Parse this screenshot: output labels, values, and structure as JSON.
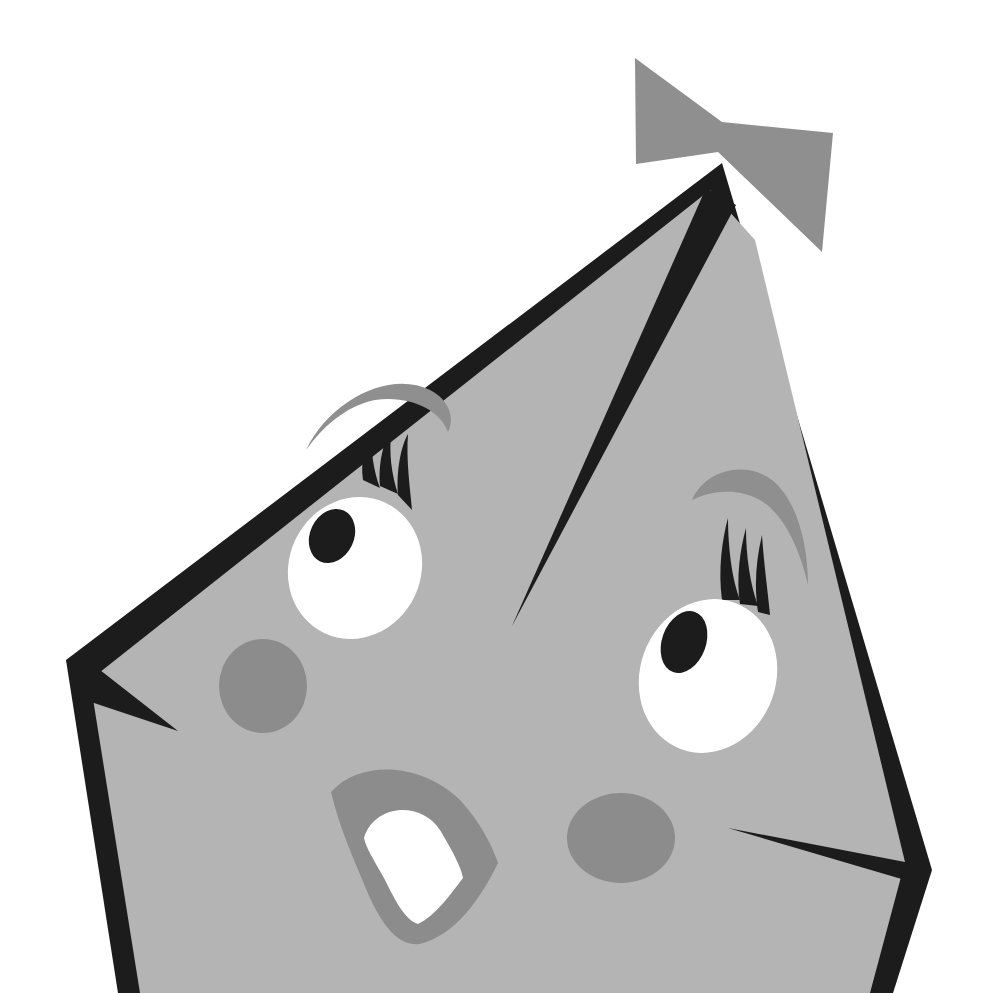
{
  "illustration": {
    "subject": "Cartoon gem character with surprised face and bow",
    "colors": {
      "background": "#ffffff",
      "body_fill": "#b4b4b4",
      "outline": "#1c1c1c",
      "bow": "#8f8f8f",
      "brows": "#8f8f8f",
      "cheeks": "#8c8c8c",
      "mouth_ring": "#8c8c8c",
      "eye_white": "#ffffff",
      "pupil": "#1c1c1c",
      "lashes": "#1c1c1c",
      "mouth_inner": "#ffffff"
    },
    "parts": [
      "bow",
      "body",
      "left-eyebrow",
      "left-eye",
      "right-eyebrow",
      "right-eye",
      "left-cheek",
      "right-cheek",
      "mouth",
      "facet-lines"
    ]
  }
}
